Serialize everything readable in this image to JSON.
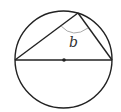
{
  "diagram": {
    "type": "geometry",
    "circle": {
      "cx": 63.5,
      "cy": 59.5,
      "r": 48.5
    },
    "center_point": {
      "x": 64,
      "y": 60
    },
    "diameter": {
      "x1": 15,
      "y1": 60,
      "x2": 112,
      "y2": 60
    },
    "apex": {
      "x": 78,
      "y": 13
    },
    "angle_label": "b",
    "colors": {
      "stroke": "#222222",
      "arc": "#aaaaaa",
      "label": "#333333",
      "background": "#ffffff"
    }
  }
}
